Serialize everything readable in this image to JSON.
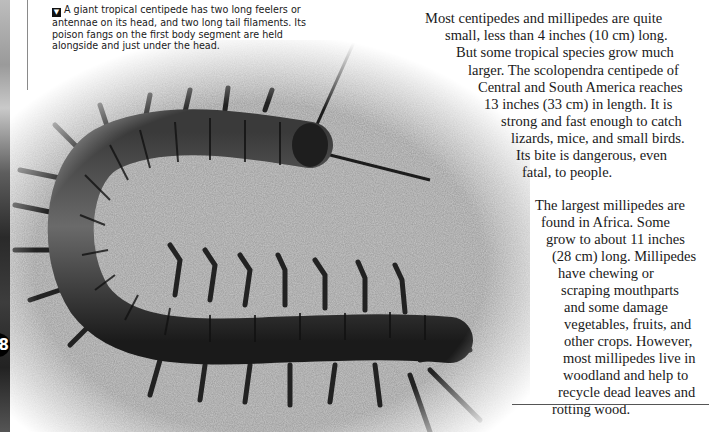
{
  "page": {
    "page_number": "8",
    "caption": {
      "icon": "caption-marker-icon",
      "lines": [
        "A giant tropical centipede has two long feelers or",
        "antennae on its head, and two long tail filaments. Its",
        "poison fangs on the first body segment are held",
        "alongside and just under the head."
      ]
    },
    "paragraphs": [
      {
        "lines": [
          "Most centipedes and millipedes are quite",
          "small, less than 4 inches (10 cm) long.",
          "But some tropical species grow much",
          "larger. The scolopendra centipede of",
          "Central and South America reaches",
          "13 inches (33 cm) in length. It is",
          "strong and fast enough to catch",
          "lizards, mice, and small birds.",
          "Its bite is dangerous, even",
          "fatal, to people."
        ]
      },
      {
        "lines": [
          "The largest millipedes are",
          "found in Africa. Some",
          "grow to about 11 inches",
          "(28 cm) long. Millipedes",
          "have chewing or",
          "scraping mouthparts",
          "and some damage",
          "vegetables, fruits, and",
          "other crops. However,",
          "most millipedes live in",
          "woodland and help to",
          "recycle dead leaves and",
          "rotting wood."
        ]
      }
    ],
    "photo": {
      "subject": "giant tropical centipede on sand"
    }
  }
}
